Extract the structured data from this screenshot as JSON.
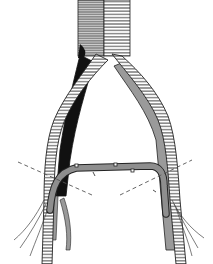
{
  "figure": {
    "type": "medical-line-illustration",
    "has_text": false,
    "colors": {
      "background": "#ffffff",
      "line": "#222222",
      "graft_fill": "#ffffff",
      "native_vessel_gray": "#9a9a9a",
      "native_vessel_dark": "#111111",
      "crossover_graft": "#8e8e8e",
      "incision_dash": "#555555"
    }
  },
  "elements": {
    "aorta": {
      "label": ""
    },
    "left_graft_limb": {
      "label": ""
    },
    "right_graft_limb": {
      "label": ""
    },
    "left_native_iliac": {
      "label": ""
    },
    "right_native_iliac": {
      "label": ""
    },
    "crossover_graft": {
      "label": ""
    },
    "left_incision_line": {
      "label": ""
    },
    "right_incision_line": {
      "label": ""
    }
  }
}
